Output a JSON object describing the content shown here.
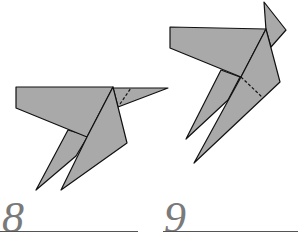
{
  "steps": [
    {
      "number": "8"
    },
    {
      "number": "9"
    }
  ],
  "colors": {
    "fill": "#a9a9a9",
    "stroke": "#111111",
    "number": "#7a7a7a"
  }
}
